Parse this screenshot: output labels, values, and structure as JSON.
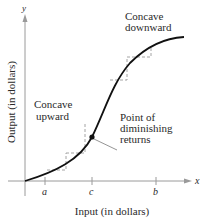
{
  "diagram": {
    "title": "",
    "axes": {
      "x_label": "Input (in dollars)",
      "y_label": "Output (in dollars)",
      "x_var": "x",
      "y_var": "y",
      "x_ticks": [
        "a",
        "c",
        "b"
      ]
    },
    "annotations": {
      "concave_upward": [
        "Concave",
        "upward"
      ],
      "concave_downward": [
        "Concave",
        "downward"
      ],
      "inflection": [
        "Point of",
        "diminishing",
        "returns"
      ]
    },
    "colors": {
      "curve": "#111111",
      "axis": "#9a9a9a",
      "guide": "#9a9a9a",
      "text": "#2a2a2a"
    }
  }
}
